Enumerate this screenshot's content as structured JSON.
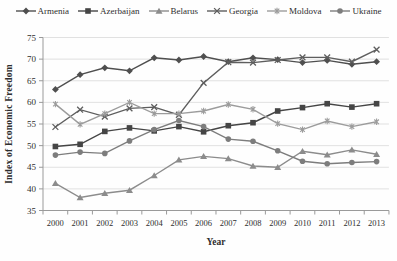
{
  "style": {
    "grid_color": "#d9d9d9",
    "axis_color": "#9a9a9a",
    "text_color": "#2e2e2e",
    "background": "#fefefe"
  },
  "chart_data": {
    "type": "line",
    "title": "",
    "xlabel": "Year",
    "ylabel": "Index of Economic Freedom",
    "x": [
      2000,
      2001,
      2002,
      2003,
      2004,
      2005,
      2006,
      2007,
      2008,
      2009,
      2010,
      2011,
      2012,
      2013
    ],
    "ylim": [
      35,
      75
    ],
    "ytick_step": 5,
    "grid": "horizontal",
    "legend_position": "top",
    "series": [
      {
        "name": "Armenia",
        "marker": "diamond",
        "color": "#4f4f4f",
        "values": [
          63.0,
          66.4,
          68.0,
          67.3,
          70.3,
          69.8,
          70.6,
          69.4,
          70.3,
          69.9,
          69.2,
          69.7,
          68.8,
          69.4
        ]
      },
      {
        "name": "Azerbaijan",
        "marker": "square",
        "color": "#454545",
        "values": [
          49.8,
          50.3,
          53.3,
          54.1,
          53.4,
          54.4,
          53.2,
          54.6,
          55.3,
          58.0,
          58.8,
          59.7,
          58.9,
          59.7
        ]
      },
      {
        "name": "Belarus",
        "marker": "triangle",
        "color": "#8c8c8c",
        "values": [
          41.3,
          38.0,
          39.0,
          39.7,
          43.1,
          46.7,
          47.5,
          47.0,
          45.3,
          45.0,
          48.7,
          47.9,
          49.0,
          48.0
        ]
      },
      {
        "name": "Georgia",
        "marker": "x",
        "color": "#5e5e5e",
        "values": [
          54.3,
          58.3,
          56.7,
          58.6,
          58.9,
          57.1,
          64.5,
          69.3,
          69.2,
          69.8,
          70.4,
          70.4,
          69.4,
          72.2
        ]
      },
      {
        "name": "Moldova",
        "marker": "asterisk",
        "color": "#9c9c9c",
        "values": [
          59.6,
          54.9,
          57.4,
          60.0,
          57.4,
          57.4,
          58.0,
          59.5,
          58.4,
          55.1,
          53.7,
          55.7,
          54.4,
          55.5
        ]
      },
      {
        "name": "Ukraine",
        "marker": "circle",
        "color": "#7d7d7d",
        "values": [
          47.8,
          48.5,
          48.2,
          51.1,
          53.7,
          55.8,
          54.4,
          51.5,
          51.0,
          48.8,
          46.4,
          45.8,
          46.1,
          46.3
        ]
      }
    ]
  }
}
